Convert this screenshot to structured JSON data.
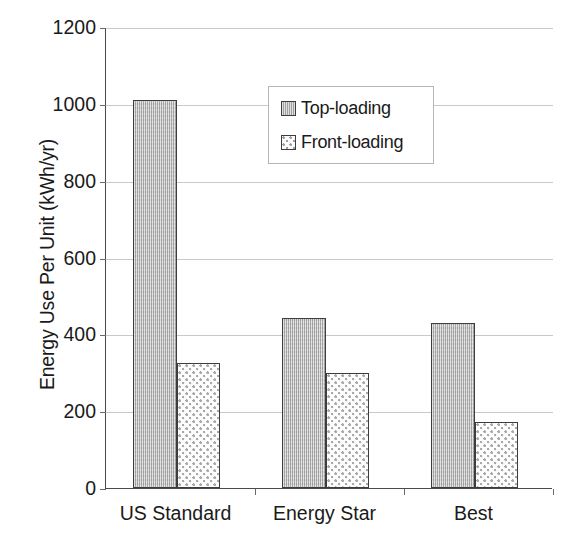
{
  "chart_data": {
    "type": "bar",
    "title": "",
    "subtitle": "",
    "xlabel": "",
    "ylabel": "Energy Use Per Unit (kWh/yr)",
    "categories": [
      "US Standard",
      "Energy Star",
      "Best"
    ],
    "series": [
      {
        "name": "Top-loading",
        "values": [
          1010,
          442,
          430
        ],
        "swatch": "top-loading",
        "color": "#b8b8b8",
        "pattern": "vertical-line-gray"
      },
      {
        "name": "Front-loading",
        "values": [
          325,
          300,
          172
        ],
        "swatch": "front-loading",
        "color": "#fdfdfd",
        "pattern": "dotted-light"
      }
    ],
    "ylim": [
      0,
      1200
    ],
    "ytick_values": [
      0,
      200,
      400,
      600,
      800,
      1000,
      1200
    ],
    "ytick_labels": [
      "0",
      "200",
      "400",
      "600",
      "800",
      "1000",
      "1200"
    ],
    "grid": true,
    "grid_axis": "y",
    "legend_position": "upper-center",
    "axis_color": "#4a4a4a",
    "grid_color": "#c9c9c9",
    "text_color": "#1a1a1a",
    "background": "#ffffff"
  },
  "legend": {
    "entries": [
      {
        "label": "Top-loading"
      },
      {
        "label": "Front-loading"
      }
    ]
  }
}
